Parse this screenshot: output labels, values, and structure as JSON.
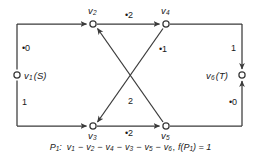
{
  "figure": {
    "type": "flow-network-diagram",
    "background_color": "#ffffff",
    "line_color": "#3a3a3a",
    "text_color": "#1a1a1a"
  },
  "nodes": [
    {
      "id": "v1",
      "name": "v1-node",
      "label": "v",
      "sub": "1",
      "paren": "(S)",
      "x": 17,
      "y": 75,
      "label_side": "right"
    },
    {
      "id": "v2",
      "name": "v2-node",
      "label": "v",
      "sub": "2",
      "paren": "",
      "x": 93,
      "y": 24,
      "label_side": "above"
    },
    {
      "id": "v3",
      "name": "v3-node",
      "label": "v",
      "sub": "3",
      "paren": "",
      "x": 93,
      "y": 126,
      "label_side": "below"
    },
    {
      "id": "v4",
      "name": "v4-node",
      "label": "v",
      "sub": "4",
      "paren": "",
      "x": 166,
      "y": 24,
      "label_side": "above"
    },
    {
      "id": "v5",
      "name": "v5-node",
      "label": "v",
      "sub": "5",
      "paren": "",
      "x": 166,
      "y": 126,
      "label_side": "below"
    },
    {
      "id": "v6",
      "name": "v6-node",
      "label": "v",
      "sub": "6",
      "paren": "(T)",
      "x": 242,
      "y": 75,
      "label_side": "left"
    }
  ],
  "edge_labels": {
    "v1_v2": "•0",
    "v1_v3": "1",
    "v2_v4": "•2",
    "v3_v5": "•2",
    "v4_v6": "1",
    "v5_v6": "•0",
    "diag_upper": "•1",
    "diag_lower": "2"
  },
  "caption": {
    "path_name": "P",
    "path_sub": "1",
    "separator": ":",
    "sequence": [
      "v1",
      "v2",
      "v4",
      "v3",
      "v5",
      "v6"
    ],
    "flow_label": "f(P",
    "flow_sub": "1",
    "flow_tail": ") = 1",
    "full_text": "P1: v1 − v2 − v4 − v3 − v5 − v6, f(P1) = 1"
  }
}
